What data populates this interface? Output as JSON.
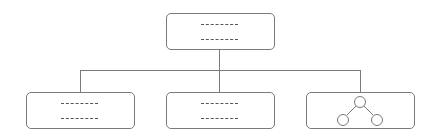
{
  "diagram": {
    "type": "org-chart",
    "colors": {
      "border": "#7a7a7a",
      "placeholder": "#555555",
      "background": "#ffffff"
    },
    "root": {
      "id": "root",
      "content": "text-placeholder",
      "lines": 2
    },
    "children": [
      {
        "id": "child-1",
        "content": "text-placeholder",
        "lines": 2
      },
      {
        "id": "child-2",
        "content": "text-placeholder",
        "lines": 2
      },
      {
        "id": "child-3",
        "content": "tree-icon"
      }
    ]
  }
}
